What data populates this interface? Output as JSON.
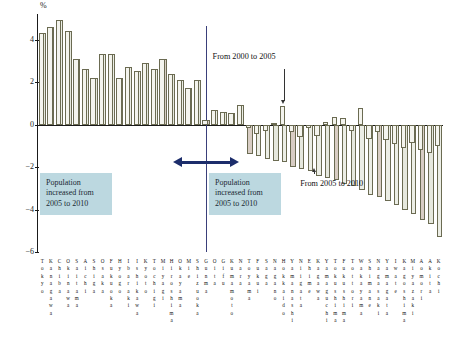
{
  "axis": {
    "unit_label": "%",
    "yticks": [
      4,
      2,
      0,
      -2,
      -4,
      -6
    ],
    "ylim": [
      -6,
      5.2
    ]
  },
  "annotations": {
    "box_left": "Population increased from 2005 to 2010",
    "box_right": "Population increased from 2005 to 2010",
    "callout_top": "From 2000 to 2005",
    "callout_bottom": "From 2005 to 2010"
  },
  "chart_data": {
    "type": "bar",
    "title": "",
    "xlabel": "",
    "ylabel": "%",
    "ylim": [
      -6,
      5.2
    ],
    "grid": false,
    "legend": "none",
    "series": [
      {
        "name": "From 2000 to 2005",
        "values": [
          4.3,
          4.6,
          4.9,
          4.4,
          3.1,
          2.6,
          2.2,
          3.3,
          3.3,
          2.2,
          2.7,
          2.5,
          2.9,
          2.6,
          3.1,
          2.4,
          2.1,
          1.7,
          2.1,
          0.2,
          0.7,
          0.6,
          0.55,
          0.9,
          -0.15,
          -0.45,
          -0.3,
          0.05,
          0.85,
          -0.35,
          -0.6,
          -0.15,
          -0.55,
          0.1,
          0.35,
          0.3,
          -0.3,
          0.8,
          -0.7,
          -0.35,
          -0.75,
          -0.9,
          -1.1,
          -0.85,
          -1.2,
          -1.35,
          -1.0
        ]
      },
      {
        "name": "From 2005 to 2010",
        "values": [
          4.3,
          4.6,
          4.9,
          4.4,
          3.1,
          2.6,
          2.2,
          3.3,
          3.3,
          2.2,
          2.7,
          2.5,
          2.9,
          2.6,
          3.1,
          2.4,
          2.1,
          1.7,
          2.1,
          0.2,
          0.7,
          0.6,
          0.55,
          0.9,
          -1.4,
          -1.5,
          -1.6,
          -1.7,
          -1.75,
          -2.0,
          -2.1,
          -2.2,
          -2.4,
          -2.5,
          -2.6,
          -2.8,
          -2.9,
          -3.1,
          -3.3,
          -3.4,
          -3.6,
          -3.8,
          -4.0,
          -4.2,
          -4.5,
          -4.7,
          -5.3
        ]
      }
    ],
    "categories": [
      "Tokyo",
      "Kanagawa",
      "Chiba",
      "Okinawa",
      "Saitama",
      "Aichi",
      "Shiga",
      "Osaka",
      "Fukuoka",
      "Hyogo",
      "Ibaraki",
      "Ishikawa",
      "Kyoto",
      "Tochigi",
      "Miyagi",
      "Hiroshima",
      "Okayama",
      "Mie",
      "Shizuoka",
      "Gunma",
      "Oita",
      "Gifu",
      "Kumamoto",
      "Nara",
      "Toyama",
      "Fukui",
      "Saga",
      "Nagano",
      "Hokkaido",
      "Yamanashi",
      "Niigata",
      "Ehime",
      "Kagawa",
      "Yamaguchi",
      "Tokushima",
      "Fukushima",
      "Tottori",
      "Wakayama",
      "Shimane",
      "Nagasaki",
      "Yamagata",
      "Iwate",
      "Kagoshima",
      "Miyazaki",
      "Aomori",
      "Akita",
      "Kochi"
    ]
  }
}
